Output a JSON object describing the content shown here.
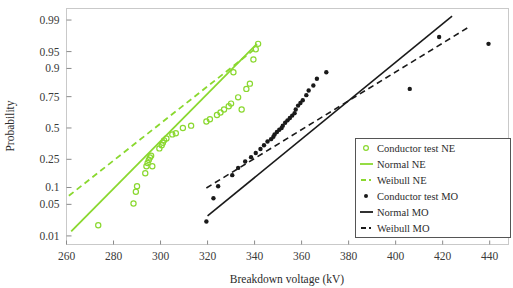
{
  "chart_data": {
    "type": "scatter",
    "title": "",
    "xlabel": "Breakdown voltage (kV)",
    "ylabel": "Probability",
    "xlim": [
      260,
      448
    ],
    "ylim": [
      0.006,
      0.995
    ],
    "xticks": [
      260,
      280,
      300,
      320,
      340,
      360,
      380,
      400,
      420,
      440
    ],
    "xticklabels": [
      "260",
      "280",
      "300",
      "320",
      "340",
      "360",
      "380",
      "400",
      "420",
      "440"
    ],
    "yticks": [
      0.01,
      0.05,
      0.1,
      0.25,
      0.5,
      0.75,
      0.9,
      0.95,
      0.99
    ],
    "yticklabels": [
      "0.01",
      "0.05",
      "0.1",
      "0.25",
      "0.5",
      "0.75",
      "0.9",
      "0.95",
      "0.99"
    ],
    "yscale": "normal-probability",
    "grid": false,
    "legend_position": "bottom-right",
    "colors": {
      "ne": "#8ad82f",
      "mo": "#1a1a1a",
      "frame": "#c9c9c9",
      "text": "#2b2b2b"
    },
    "series": [
      {
        "name": "Conductor test NE",
        "type": "scatter",
        "marker": "open-circle",
        "color": "#8ad82f",
        "points": [
          [
            273.5,
            0.018
          ],
          [
            288.5,
            0.052
          ],
          [
            289.5,
            0.085
          ],
          [
            290.0,
            0.105
          ],
          [
            293.5,
            0.165
          ],
          [
            294.0,
            0.205
          ],
          [
            294.5,
            0.225
          ],
          [
            295.0,
            0.245
          ],
          [
            295.5,
            0.262
          ],
          [
            296.0,
            0.275
          ],
          [
            296.5,
            0.205
          ],
          [
            299.5,
            0.33
          ],
          [
            300.5,
            0.355
          ],
          [
            301.0,
            0.375
          ],
          [
            301.5,
            0.395
          ],
          [
            302.5,
            0.41
          ],
          [
            305.0,
            0.445
          ],
          [
            306.5,
            0.455
          ],
          [
            309.5,
            0.5
          ],
          [
            313.0,
            0.52
          ],
          [
            319.5,
            0.555
          ],
          [
            321.0,
            0.575
          ],
          [
            324.0,
            0.61
          ],
          [
            325.5,
            0.63
          ],
          [
            327.0,
            0.655
          ],
          [
            329.0,
            0.68
          ],
          [
            330.0,
            0.7
          ],
          [
            333.0,
            0.745
          ],
          [
            334.5,
            0.655
          ],
          [
            336.5,
            0.8
          ],
          [
            338.0,
            0.83
          ],
          [
            339.5,
            0.93
          ],
          [
            340.5,
            0.955
          ],
          [
            341.5,
            0.965
          ],
          [
            331.0,
            0.885
          ]
        ]
      },
      {
        "name": "Normal NE",
        "type": "line",
        "style": "solid",
        "color": "#8ad82f",
        "endpoints": [
          [
            262.0,
            0.013
          ],
          [
            341.0,
            0.965
          ]
        ]
      },
      {
        "name": "Weibull NE",
        "type": "line",
        "style": "dashed",
        "color": "#8ad82f",
        "endpoints": [
          [
            261.0,
            0.072
          ],
          [
            340.0,
            0.955
          ]
        ]
      },
      {
        "name": "Conductor test MO",
        "type": "scatter",
        "marker": "filled-circle",
        "color": "#1a1a1a",
        "points": [
          [
            319.5,
            0.022
          ],
          [
            322.5,
            0.065
          ],
          [
            324.5,
            0.105
          ],
          [
            330.5,
            0.155
          ],
          [
            333.0,
            0.195
          ],
          [
            336.0,
            0.235
          ],
          [
            338.5,
            0.265
          ],
          [
            340.5,
            0.295
          ],
          [
            342.5,
            0.325
          ],
          [
            344.0,
            0.355
          ],
          [
            345.5,
            0.385
          ],
          [
            347.0,
            0.405
          ],
          [
            348.0,
            0.425
          ],
          [
            348.5,
            0.445
          ],
          [
            349.5,
            0.465
          ],
          [
            350.5,
            0.485
          ],
          [
            351.5,
            0.5
          ],
          [
            352.0,
            0.52
          ],
          [
            353.0,
            0.545
          ],
          [
            354.0,
            0.565
          ],
          [
            355.0,
            0.585
          ],
          [
            356.0,
            0.605
          ],
          [
            357.0,
            0.625
          ],
          [
            357.5,
            0.655
          ],
          [
            358.5,
            0.685
          ],
          [
            359.5,
            0.705
          ],
          [
            360.5,
            0.725
          ],
          [
            362.0,
            0.76
          ],
          [
            363.0,
            0.79
          ],
          [
            365.0,
            0.82
          ],
          [
            366.5,
            0.855
          ],
          [
            370.5,
            0.885
          ],
          [
            406.0,
            0.8
          ],
          [
            418.5,
            0.975
          ],
          [
            439.5,
            0.965
          ]
        ]
      },
      {
        "name": "Normal MO",
        "type": "line",
        "style": "solid",
        "color": "#1a1a1a",
        "endpoints": [
          [
            320.0,
            0.029
          ],
          [
            424.0,
            0.992
          ]
        ]
      },
      {
        "name": "Weibull MO",
        "type": "line",
        "style": "dashed",
        "color": "#1a1a1a",
        "endpoints": [
          [
            319.5,
            0.098
          ],
          [
            431.0,
            0.985
          ]
        ]
      }
    ],
    "legend_entries": [
      {
        "label": "Conductor test NE",
        "marker": "open-circle",
        "color": "#8ad82f"
      },
      {
        "label": "Normal NE",
        "marker": "solid-line",
        "color": "#8ad82f"
      },
      {
        "label": "Weibull NE",
        "marker": "dashed-line",
        "color": "#8ad82f"
      },
      {
        "label": "Conductor test MO",
        "marker": "filled-circle",
        "color": "#1a1a1a"
      },
      {
        "label": "Normal MO",
        "marker": "solid-line",
        "color": "#1a1a1a"
      },
      {
        "label": "Weibull MO",
        "marker": "dashed-line",
        "color": "#1a1a1a"
      }
    ]
  }
}
